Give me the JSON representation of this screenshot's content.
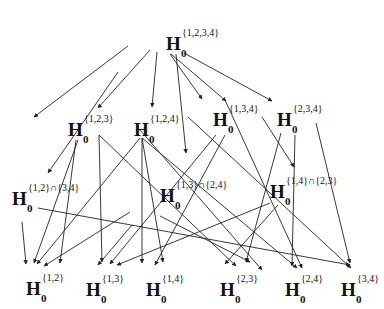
{
  "diagram": {
    "type": "hypothesis-closure-lattice",
    "symbol": "H",
    "subscript": "0",
    "nodes": [
      {
        "id": "n1234",
        "sup": "{1,2,3,4}",
        "x": 166,
        "y": 28
      },
      {
        "id": "n123",
        "sup": "{1,2,3}",
        "x": 68,
        "y": 114
      },
      {
        "id": "n124",
        "sup": "{1,2,4}",
        "x": 134,
        "y": 114
      },
      {
        "id": "n134",
        "sup": "{1,3,4}",
        "x": 213,
        "y": 104
      },
      {
        "id": "n234",
        "sup": "{2,3,4}",
        "x": 277,
        "y": 104
      },
      {
        "id": "n12_34",
        "sup": "{1,2}∩{3,4}",
        "x": 12,
        "y": 183
      },
      {
        "id": "n13_24",
        "sup": "{1,3}∩{2,4}",
        "x": 160,
        "y": 180
      },
      {
        "id": "n14_23",
        "sup": "{1,4}∩{2,3}",
        "x": 270,
        "y": 176
      },
      {
        "id": "n12",
        "sup": "{1,2}",
        "x": 26,
        "y": 273
      },
      {
        "id": "n13",
        "sup": "{1,3}",
        "x": 86,
        "y": 274
      },
      {
        "id": "n14",
        "sup": "{1,4}",
        "x": 146,
        "y": 274
      },
      {
        "id": "n23",
        "sup": "{2,3}",
        "x": 220,
        "y": 274
      },
      {
        "id": "n24",
        "sup": "{2,4}",
        "x": 285,
        "y": 274
      },
      {
        "id": "n34",
        "sup": "{3,4}",
        "x": 341,
        "y": 274
      }
    ],
    "edges": [
      {
        "from": "n1234",
        "to": "n123"
      },
      {
        "from": "n1234",
        "to": "n124"
      },
      {
        "from": "n1234",
        "to": "n134"
      },
      {
        "from": "n1234",
        "to": "n234"
      },
      {
        "from": "n1234",
        "to": "n12_34"
      },
      {
        "from": "n1234",
        "to": "n13_24"
      },
      {
        "from": "n1234",
        "to": "n14_23"
      },
      {
        "from": "n123",
        "to": "n12"
      },
      {
        "from": "n123",
        "to": "n13"
      },
      {
        "from": "n123",
        "to": "n23"
      },
      {
        "from": "n124",
        "to": "n12"
      },
      {
        "from": "n124",
        "to": "n14"
      },
      {
        "from": "n124",
        "to": "n24"
      },
      {
        "from": "n134",
        "to": "n13"
      },
      {
        "from": "n134",
        "to": "n14"
      },
      {
        "from": "n134",
        "to": "n34"
      },
      {
        "from": "n234",
        "to": "n23"
      },
      {
        "from": "n234",
        "to": "n24"
      },
      {
        "from": "n234",
        "to": "n34"
      },
      {
        "from": "n12_34",
        "to": "n12"
      },
      {
        "from": "n12_34",
        "to": "n34"
      },
      {
        "from": "n13_24",
        "to": "n13"
      },
      {
        "from": "n13_24",
        "to": "n24"
      },
      {
        "from": "n14_23",
        "to": "n14"
      },
      {
        "from": "n14_23",
        "to": "n23"
      }
    ]
  },
  "lines": [
    [
      128,
      46,
      34,
      117
    ],
    [
      150,
      50,
      98,
      108
    ],
    [
      157,
      52,
      152,
      107
    ],
    [
      170,
      54,
      202,
      99
    ],
    [
      171,
      54,
      226,
      101
    ],
    [
      176,
      54,
      186,
      153
    ],
    [
      184,
      53,
      272,
      101
    ],
    [
      118,
      72,
      48,
      173
    ],
    [
      76,
      140,
      60,
      263
    ],
    [
      78,
      140,
      34,
      263
    ],
    [
      99,
      135,
      102,
      262
    ],
    [
      99,
      135,
      236,
      266
    ],
    [
      142,
      138,
      142,
      263
    ],
    [
      142,
      138,
      163,
      262
    ],
    [
      142,
      138,
      297,
      268
    ],
    [
      140,
      138,
      37,
      264
    ],
    [
      216,
      135,
      110,
      264
    ],
    [
      225,
      135,
      155,
      265
    ],
    [
      188,
      117,
      351,
      268
    ],
    [
      262,
      117,
      294,
      167
    ],
    [
      281,
      133,
      246,
      262
    ],
    [
      295,
      135,
      292,
      266
    ],
    [
      316,
      123,
      350,
      263
    ],
    [
      22,
      222,
      26,
      264
    ],
    [
      38,
      208,
      350,
      265
    ],
    [
      130,
      212,
      44,
      266
    ],
    [
      132,
      225,
      98,
      265
    ],
    [
      160,
      216,
      250,
      262
    ],
    [
      270,
      203,
      117,
      265
    ],
    [
      278,
      205,
      225,
      264
    ],
    [
      140,
      130,
      262,
      270
    ],
    [
      225,
      100,
      302,
      268
    ]
  ],
  "colors": {
    "line": "#222222",
    "text": "#111111",
    "background": "#ffffff"
  }
}
